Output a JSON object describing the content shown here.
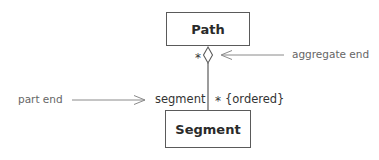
{
  "diagram": {
    "type": "uml-class-aggregation",
    "classes": {
      "whole": {
        "name": "Path"
      },
      "part": {
        "name": "Segment"
      }
    },
    "association": {
      "whole_end": {
        "multiplicity": "*",
        "adornment": "hollow-diamond"
      },
      "part_end": {
        "role": "segment",
        "multiplicity": "*",
        "constraint": "{ordered}"
      }
    },
    "annotations": {
      "aggregate_end": "aggregate end",
      "part_end": "part end"
    },
    "colors": {
      "line": "#5a5a5a",
      "annotation_text": "#666666",
      "class_text": "#2a2a2a"
    }
  }
}
